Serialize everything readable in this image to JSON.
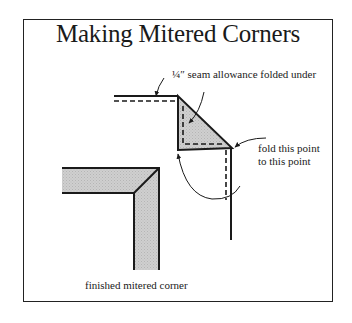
{
  "diagram": {
    "title": "Making Mitered Corners",
    "labels": {
      "seam_allowance": "¼″ seam allowance folded under",
      "fold_line1": "fold this point",
      "fold_line2": "to this point",
      "finished": "finished mitered corner"
    },
    "colors": {
      "stroke": "#1a1a1a",
      "fill_shade": "#c8c8c8",
      "background": "#ffffff"
    }
  }
}
